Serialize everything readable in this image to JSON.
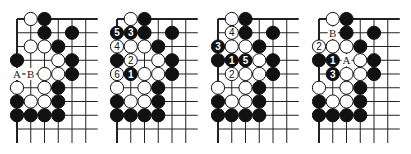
{
  "figure": {
    "type": "go-problem-diagrams",
    "grid": {
      "cols": 6,
      "rows": 9,
      "spacing": 13.75,
      "line_extend_right": 12,
      "line_extend_bottom": 14,
      "top_edge": true,
      "left_edge": true
    },
    "colors": {
      "line": "#222222",
      "black_stone": "#111111",
      "white_stone": "#ffffff",
      "stone_outline": "#111111",
      "background": "#ffffff"
    },
    "boards": [
      {
        "id": "diagram-1",
        "origin": [
          17,
          19
        ],
        "stones": [
          {
            "c": 1,
            "r": 0,
            "color": "W"
          },
          {
            "c": 2,
            "r": 0,
            "color": "B"
          },
          {
            "c": 2,
            "r": 1,
            "color": "B"
          },
          {
            "c": 4,
            "r": 1,
            "color": "B"
          },
          {
            "c": 1,
            "r": 2,
            "color": "W"
          },
          {
            "c": 2,
            "r": 2,
            "color": "W"
          },
          {
            "c": 3,
            "r": 2,
            "color": "B"
          },
          {
            "c": 0,
            "r": 3,
            "color": "B"
          },
          {
            "c": 3,
            "r": 3,
            "color": "W"
          },
          {
            "c": 4,
            "r": 3,
            "color": "B"
          },
          {
            "c": 2,
            "r": 4,
            "color": "W"
          },
          {
            "c": 3,
            "r": 4,
            "color": "W"
          },
          {
            "c": 4,
            "r": 4,
            "color": "B"
          },
          {
            "c": 0,
            "r": 5,
            "color": "W"
          },
          {
            "c": 2,
            "r": 5,
            "color": "W"
          },
          {
            "c": 3,
            "r": 5,
            "color": "B"
          },
          {
            "c": 0,
            "r": 6,
            "color": "B"
          },
          {
            "c": 1,
            "r": 6,
            "color": "W"
          },
          {
            "c": 2,
            "r": 6,
            "color": "W"
          },
          {
            "c": 3,
            "r": 6,
            "color": "B"
          },
          {
            "c": 0,
            "r": 7,
            "color": "B"
          },
          {
            "c": 1,
            "r": 7,
            "color": "B"
          },
          {
            "c": 2,
            "r": 7,
            "color": "B"
          },
          {
            "c": 3,
            "r": 7,
            "color": "B"
          }
        ],
        "labels": [
          {
            "c": 0,
            "r": 4,
            "text": "A"
          },
          {
            "c": 1,
            "r": 4,
            "text": "B"
          }
        ],
        "between_marks": [
          {
            "c": 0.5,
            "r": 4,
            "text": "·"
          }
        ]
      },
      {
        "id": "diagram-2",
        "origin": [
          117,
          19
        ],
        "stones": [
          {
            "c": 1,
            "r": 0,
            "color": "W"
          },
          {
            "c": 2,
            "r": 0,
            "color": "B"
          },
          {
            "c": 0,
            "r": 1,
            "color": "B",
            "num": "5"
          },
          {
            "c": 1,
            "r": 1,
            "color": "B",
            "num": "3"
          },
          {
            "c": 2,
            "r": 1,
            "color": "B"
          },
          {
            "c": 4,
            "r": 1,
            "color": "B"
          },
          {
            "c": 0,
            "r": 2,
            "color": "W",
            "num": "4"
          },
          {
            "c": 1,
            "r": 2,
            "color": "W"
          },
          {
            "c": 2,
            "r": 2,
            "color": "W"
          },
          {
            "c": 3,
            "r": 2,
            "color": "B"
          },
          {
            "c": 0,
            "r": 3,
            "color": "B"
          },
          {
            "c": 1,
            "r": 3,
            "color": "W",
            "num": "2"
          },
          {
            "c": 3,
            "r": 3,
            "color": "W"
          },
          {
            "c": 4,
            "r": 3,
            "color": "B"
          },
          {
            "c": 0,
            "r": 4,
            "color": "W",
            "num": "6"
          },
          {
            "c": 1,
            "r": 4,
            "color": "B",
            "num": "1"
          },
          {
            "c": 2,
            "r": 4,
            "color": "W"
          },
          {
            "c": 3,
            "r": 4,
            "color": "W"
          },
          {
            "c": 4,
            "r": 4,
            "color": "B"
          },
          {
            "c": 0,
            "r": 5,
            "color": "W"
          },
          {
            "c": 2,
            "r": 5,
            "color": "W"
          },
          {
            "c": 3,
            "r": 5,
            "color": "B"
          },
          {
            "c": 0,
            "r": 6,
            "color": "B"
          },
          {
            "c": 1,
            "r": 6,
            "color": "W"
          },
          {
            "c": 2,
            "r": 6,
            "color": "W"
          },
          {
            "c": 3,
            "r": 6,
            "color": "B"
          },
          {
            "c": 0,
            "r": 7,
            "color": "B"
          },
          {
            "c": 1,
            "r": 7,
            "color": "B"
          },
          {
            "c": 2,
            "r": 7,
            "color": "B"
          },
          {
            "c": 3,
            "r": 7,
            "color": "B"
          }
        ],
        "labels": [],
        "between_marks": []
      },
      {
        "id": "diagram-3",
        "origin": [
          218,
          19
        ],
        "stones": [
          {
            "c": 1,
            "r": 0,
            "color": "W"
          },
          {
            "c": 2,
            "r": 0,
            "color": "B"
          },
          {
            "c": 1,
            "r": 1,
            "color": "W",
            "num": "4"
          },
          {
            "c": 2,
            "r": 1,
            "color": "B"
          },
          {
            "c": 4,
            "r": 1,
            "color": "B"
          },
          {
            "c": 0,
            "r": 2,
            "color": "B",
            "num": "3"
          },
          {
            "c": 1,
            "r": 2,
            "color": "W"
          },
          {
            "c": 2,
            "r": 2,
            "color": "W"
          },
          {
            "c": 3,
            "r": 2,
            "color": "B"
          },
          {
            "c": 0,
            "r": 3,
            "color": "B"
          },
          {
            "c": 1,
            "r": 3,
            "color": "B",
            "num": "1"
          },
          {
            "c": 2,
            "r": 3,
            "color": "B",
            "num": "5"
          },
          {
            "c": 3,
            "r": 3,
            "color": "W"
          },
          {
            "c": 4,
            "r": 3,
            "color": "B"
          },
          {
            "c": 1,
            "r": 4,
            "color": "W",
            "num": "2"
          },
          {
            "c": 2,
            "r": 4,
            "color": "W"
          },
          {
            "c": 3,
            "r": 4,
            "color": "W"
          },
          {
            "c": 4,
            "r": 4,
            "color": "B"
          },
          {
            "c": 0,
            "r": 5,
            "color": "W"
          },
          {
            "c": 2,
            "r": 5,
            "color": "W"
          },
          {
            "c": 3,
            "r": 5,
            "color": "B"
          },
          {
            "c": 0,
            "r": 6,
            "color": "B"
          },
          {
            "c": 1,
            "r": 6,
            "color": "W"
          },
          {
            "c": 2,
            "r": 6,
            "color": "W"
          },
          {
            "c": 3,
            "r": 6,
            "color": "B"
          },
          {
            "c": 0,
            "r": 7,
            "color": "B"
          },
          {
            "c": 1,
            "r": 7,
            "color": "B"
          },
          {
            "c": 2,
            "r": 7,
            "color": "B"
          },
          {
            "c": 3,
            "r": 7,
            "color": "B"
          }
        ],
        "labels": [],
        "between_marks": []
      },
      {
        "id": "diagram-4",
        "origin": [
          319,
          19
        ],
        "stones": [
          {
            "c": 1,
            "r": 0,
            "color": "W"
          },
          {
            "c": 2,
            "r": 0,
            "color": "B"
          },
          {
            "c": 2,
            "r": 1,
            "color": "B"
          },
          {
            "c": 4,
            "r": 1,
            "color": "B"
          },
          {
            "c": 0,
            "r": 2,
            "color": "W",
            "num": "2"
          },
          {
            "c": 1,
            "r": 2,
            "color": "W"
          },
          {
            "c": 2,
            "r": 2,
            "color": "W"
          },
          {
            "c": 3,
            "r": 2,
            "color": "B"
          },
          {
            "c": 0,
            "r": 3,
            "color": "B"
          },
          {
            "c": 1,
            "r": 3,
            "color": "B",
            "num": "1"
          },
          {
            "c": 3,
            "r": 3,
            "color": "W"
          },
          {
            "c": 4,
            "r": 3,
            "color": "B"
          },
          {
            "c": 1,
            "r": 4,
            "color": "B",
            "num": "3"
          },
          {
            "c": 2,
            "r": 4,
            "color": "W"
          },
          {
            "c": 3,
            "r": 4,
            "color": "W"
          },
          {
            "c": 4,
            "r": 4,
            "color": "B"
          },
          {
            "c": 0,
            "r": 5,
            "color": "W"
          },
          {
            "c": 2,
            "r": 5,
            "color": "W"
          },
          {
            "c": 3,
            "r": 5,
            "color": "B"
          },
          {
            "c": 0,
            "r": 6,
            "color": "B"
          },
          {
            "c": 1,
            "r": 6,
            "color": "W"
          },
          {
            "c": 2,
            "r": 6,
            "color": "W"
          },
          {
            "c": 3,
            "r": 6,
            "color": "B"
          },
          {
            "c": 0,
            "r": 7,
            "color": "B"
          },
          {
            "c": 1,
            "r": 7,
            "color": "B"
          },
          {
            "c": 2,
            "r": 7,
            "color": "B"
          },
          {
            "c": 3,
            "r": 7,
            "color": "B"
          }
        ],
        "labels": [
          {
            "c": 1,
            "r": 1,
            "text": "B"
          },
          {
            "c": 2,
            "r": 3,
            "text": "A"
          }
        ],
        "between_marks": []
      }
    ]
  }
}
